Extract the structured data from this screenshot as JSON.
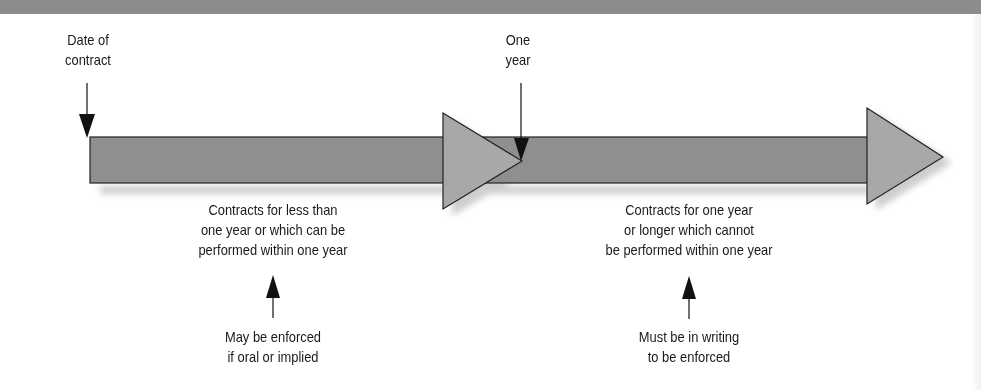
{
  "diagram": {
    "type": "timeline",
    "markers": {
      "start": {
        "label_lines": [
          "Date of",
          "contract"
        ]
      },
      "one_year": {
        "label_lines": [
          "One",
          "year"
        ]
      }
    },
    "segments": [
      {
        "id": "under-one-year",
        "description_lines": [
          "Contracts for less than",
          "one year or which can be",
          "performed within one year"
        ],
        "rule_lines": [
          "May be enforced",
          "if oral or implied"
        ]
      },
      {
        "id": "one-year-or-longer",
        "description_lines": [
          "Contracts for one year",
          "or longer which cannot",
          "be performed within one year"
        ],
        "rule_lines": [
          "Must be in writing",
          "to be enforced"
        ]
      }
    ],
    "colors": {
      "top_band": "#8c8c8c",
      "bar_fill": "#8f8f8f",
      "arrowhead_fill": "#a8a8a8",
      "shadow": "#c8c8c8",
      "outline": "#222222",
      "text": "#1a1a1a"
    }
  }
}
